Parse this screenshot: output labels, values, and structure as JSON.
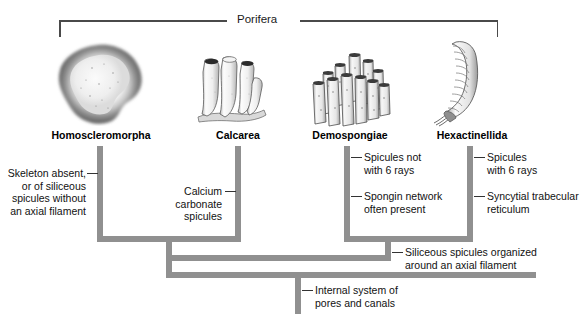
{
  "figure": {
    "group_label": "Porifera"
  },
  "taxa": [
    {
      "name": "Homoscleromorpha",
      "icon": "encrusting-sponge-illustration"
    },
    {
      "name": "Calcarea",
      "icon": "vase-sponge-illustration"
    },
    {
      "name": "Demospongiae",
      "icon": "tube-sponge-cluster-illustration"
    },
    {
      "name": "Hexactinellida",
      "icon": "glass-sponge-illustration"
    }
  ],
  "characters": [
    {
      "id": "homoscleromorpha-character",
      "text": "Skeleton absent,\nor of siliceous\nspicules without\nan axial filament"
    },
    {
      "id": "calcarea-character",
      "text": "Calcium\ncarbonate\nspicules"
    },
    {
      "id": "demospongiae-character-1",
      "text": "Spicules not\nwith 6 rays"
    },
    {
      "id": "demospongiae-character-2",
      "text": "Spongin network\noften present"
    },
    {
      "id": "hexactinellida-character-1",
      "text": "Spicules\nwith 6 rays"
    },
    {
      "id": "hexactinellida-character-2",
      "text": "Syncytial trabecular\nreticulum"
    },
    {
      "id": "siliceous-clade-character",
      "text": "Siliceous spicules organized\naround an axial filament"
    },
    {
      "id": "root-character",
      "text": "Internal  system of\npores  and canals"
    }
  ],
  "colors": {
    "branch": "#909090",
    "bracket": "#4a4a4a",
    "text": "#111111"
  }
}
